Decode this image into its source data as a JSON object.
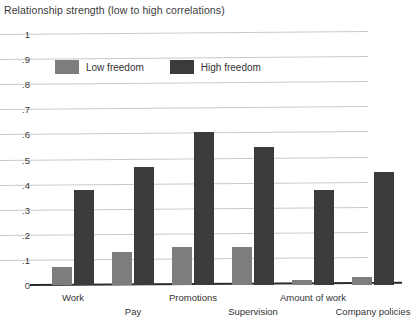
{
  "chart_data": {
    "type": "bar",
    "title": "Relationship strength (low to high correlations)",
    "xlabel": "",
    "ylabel": "",
    "ylim": [
      0,
      1
    ],
    "grid": true,
    "legend_position": "top-left-inside",
    "categories": [
      "Work",
      "Pay",
      "Promotions",
      "Supervision",
      "Amount of work",
      "Company policies"
    ],
    "ytick_labels": [
      "1",
      ".9",
      ".8",
      ".7",
      ".6",
      ".5",
      ".4",
      ".3",
      ".2",
      ".1",
      "0"
    ],
    "ytick_values": [
      1,
      0.9,
      0.8,
      0.7,
      0.6,
      0.5,
      0.4,
      0.3,
      0.2,
      0.1,
      0
    ],
    "series": [
      {
        "name": "Low freedom",
        "color": "#7d7d7d",
        "values": [
          0.07,
          0.13,
          0.15,
          0.15,
          0.02,
          0.03
        ]
      },
      {
        "name": "High freedom",
        "color": "#3b3b3b",
        "values": [
          0.38,
          0.47,
          0.61,
          0.55,
          0.38,
          0.45
        ]
      }
    ]
  },
  "legend": {
    "items": [
      {
        "label": "Low freedom",
        "color": "#7d7d7d"
      },
      {
        "label": "High freedom",
        "color": "#3b3b3b"
      }
    ]
  }
}
